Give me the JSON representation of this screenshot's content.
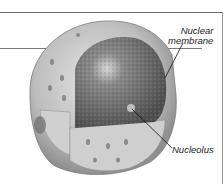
{
  "figure": {
    "labels": {
      "nuclear_membrane_line1": "Nuclear",
      "nuclear_membrane_line2": "membrane",
      "nucleolus": "Nucleolus"
    },
    "colors": {
      "envelope": "#c9c9c9",
      "nucleoplasm": "#6e6e6e",
      "leader_line": "#111111",
      "frame": "#6a6a6a"
    }
  }
}
